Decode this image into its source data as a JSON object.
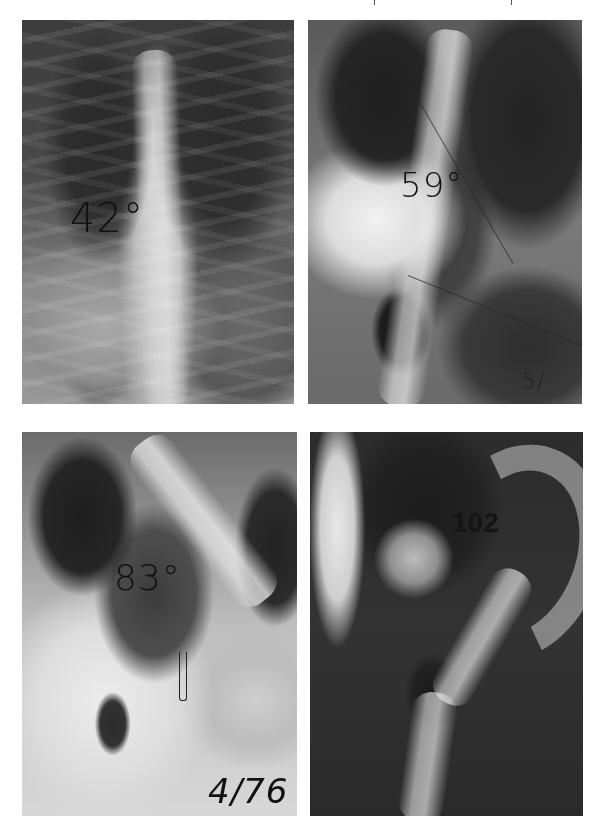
{
  "figure": {
    "layout": "2x2 grid of spinal radiographs",
    "panels": [
      {
        "position": "top-left",
        "annotation": "42°",
        "description": "Frontal chest radiograph, mild thoracic curve"
      },
      {
        "position": "top-right",
        "annotation": "59°",
        "corner_mark": "5/",
        "description": "Frontal radiograph with Cobb angle measurement lines"
      },
      {
        "position": "bottom-left",
        "annotation": "83°",
        "date_mark": "4/76",
        "description": "Frontal radiograph, severe thoracic curve"
      },
      {
        "position": "bottom-right",
        "annotation": "102",
        "description": "Frontal radiograph, very severe S-shaped curve"
      }
    ]
  }
}
